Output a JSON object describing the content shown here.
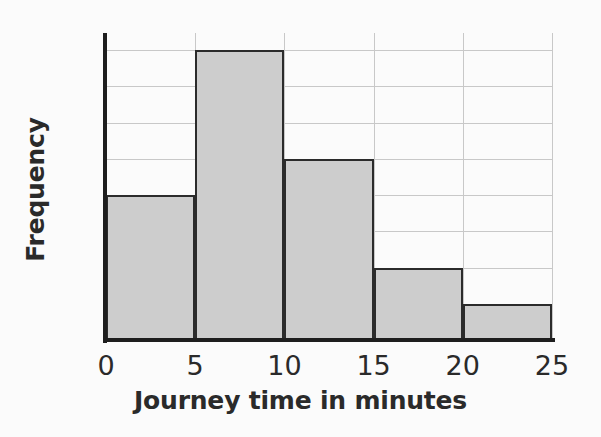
{
  "chart_data": {
    "type": "bar",
    "title": "",
    "subtitle": "",
    "xlabel": "Journey time in minutes",
    "ylabel": "Frequency",
    "categories": [
      "0-5",
      "5-10",
      "10-15",
      "15-20",
      "20-25"
    ],
    "bin_edges": [
      0,
      5,
      10,
      15,
      20,
      25
    ],
    "values": [
      40,
      80,
      50,
      20,
      10
    ],
    "xlim": [
      0,
      25
    ],
    "ylim": [
      0,
      80
    ],
    "xticks": [
      "0",
      "5",
      "10",
      "15",
      "20",
      "25"
    ],
    "xtick_values": [
      0,
      5,
      10,
      15,
      20,
      25
    ],
    "yticks": [
      "0",
      "10",
      "20",
      "30",
      "40",
      "50",
      "60",
      "70",
      "80"
    ],
    "ytick_values": [
      0,
      10,
      20,
      30,
      40,
      50,
      60,
      70,
      80
    ],
    "grid": true,
    "grid_axes": "both",
    "legend": false,
    "legend_position": "none",
    "annotations": [],
    "colors": {
      "bar_fill": "#cdcdcd",
      "bar_edge": "#2b2b2b",
      "axis": "#1e1e1e",
      "gridline": "#c8c8c8",
      "text": "#2a2a2a",
      "background": "#fbfbfb"
    }
  }
}
